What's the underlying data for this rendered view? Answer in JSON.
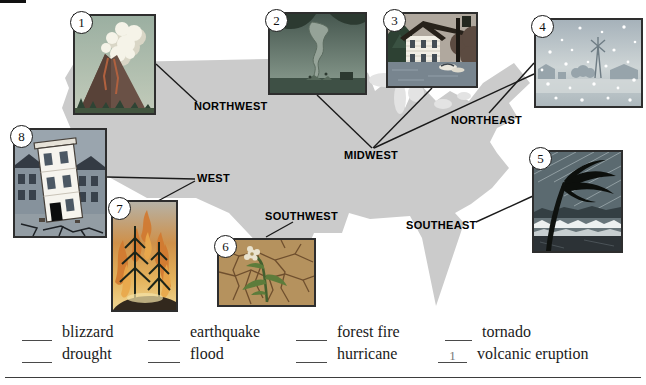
{
  "regions": {
    "northwest": "NORTHWEST",
    "midwest": "MIDWEST",
    "northeast": "NORTHEAST",
    "west": "WEST",
    "southwest": "SOUTHWEST",
    "southeast": "SOUTHEAST"
  },
  "cards": [
    {
      "number": "1",
      "disaster": "volcanic eruption"
    },
    {
      "number": "2",
      "disaster": "tornado"
    },
    {
      "number": "3",
      "disaster": "flood"
    },
    {
      "number": "4",
      "disaster": "blizzard"
    },
    {
      "number": "5",
      "disaster": "hurricane"
    },
    {
      "number": "6",
      "disaster": "drought"
    },
    {
      "number": "7",
      "disaster": "forest fire"
    },
    {
      "number": "8",
      "disaster": "earthquake"
    }
  ],
  "word_bank": {
    "rows": [
      [
        {
          "word": "blizzard",
          "answer": ""
        },
        {
          "word": "earthquake",
          "answer": ""
        },
        {
          "word": "forest fire",
          "answer": ""
        },
        {
          "word": "tornado",
          "answer": ""
        }
      ],
      [
        {
          "word": "drought",
          "answer": ""
        },
        {
          "word": "flood",
          "answer": ""
        },
        {
          "word": "hurricane",
          "answer": ""
        },
        {
          "word": "volcanic eruption",
          "answer": "1"
        }
      ]
    ]
  },
  "colors": {
    "map_fill": "#cbcbcb",
    "lakes": "#e3e3e3",
    "connector": "#1a1a1a",
    "label_text": "#000000",
    "card_frame": "#2e2e2e",
    "page_bg": "#ffffff"
  }
}
